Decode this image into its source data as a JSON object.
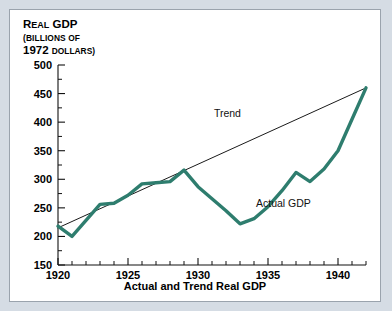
{
  "figure": {
    "caption": "Actual and Trend Real GDP",
    "axis_title_lines": [
      "Real GDP",
      "(Billions of",
      "1972 dollars)"
    ],
    "axis_title_parts": {
      "line1_cap": "R",
      "line1_rest": "EAL",
      "line1_tail": " GDP",
      "line2": "(BILLIONS OF",
      "line3_num": "1972 ",
      "line3_rest": "DOLLARS)"
    },
    "colors": {
      "actual": "#2e7d6e",
      "trend": "#1a1a1a",
      "page_background": "#d5dce4",
      "panel_background": "#ffffff",
      "panel_border": "#9aa3ad"
    }
  },
  "chart_data": {
    "type": "line",
    "title": "Actual and Trend Real GDP",
    "xlabel": "",
    "ylabel": "Real GDP (Billions of 1972 dollars)",
    "xlim": [
      1920,
      1942
    ],
    "ylim": [
      150,
      500
    ],
    "grid": false,
    "legend": "inline-annotations",
    "y_ticks_major": [
      150,
      200,
      250,
      300,
      350,
      400,
      450,
      500
    ],
    "y_ticks_minor": [
      175,
      225,
      275,
      325,
      375,
      425,
      475
    ],
    "x_ticks_major": [
      1920,
      1925,
      1930,
      1935,
      1940
    ],
    "x_ticks_minor": [
      1921,
      1922,
      1923,
      1924,
      1926,
      1927,
      1928,
      1929,
      1931,
      1932,
      1933,
      1934,
      1936,
      1937,
      1938,
      1939,
      1941,
      1942
    ],
    "x": [
      1920,
      1921,
      1922,
      1923,
      1924,
      1925,
      1926,
      1927,
      1928,
      1929,
      1930,
      1931,
      1932,
      1933,
      1934,
      1935,
      1936,
      1937,
      1938,
      1939,
      1940,
      1941,
      1942
    ],
    "series": [
      {
        "name": "Actual GDP",
        "color": "#2e7d6e",
        "width": 3.4,
        "label_x": 1936.1,
        "label_y": 252,
        "values": [
          218,
          200,
          228,
          256,
          258,
          272,
          292,
          294,
          296,
          316,
          287,
          266,
          245,
          222,
          231,
          252,
          280,
          312,
          296,
          318,
          350,
          405,
          460
        ]
      },
      {
        "name": "Trend",
        "color": "#1a1a1a",
        "width": 1,
        "label_x": 1932.1,
        "label_y": 409,
        "x": [
          1920,
          1942
        ],
        "values": [
          215,
          460
        ]
      }
    ]
  }
}
